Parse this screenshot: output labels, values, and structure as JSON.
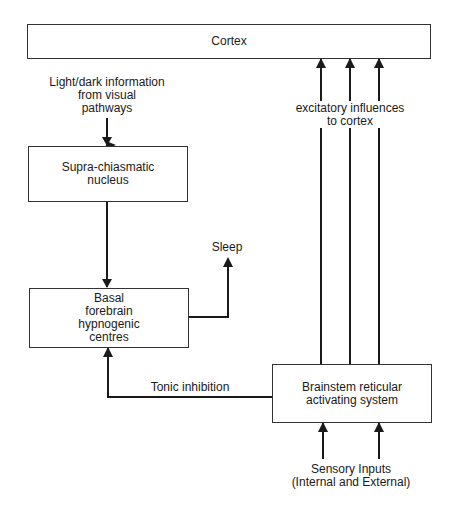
{
  "diagram": {
    "nodes": {
      "cortex": {
        "lines": [
          "Cortex"
        ]
      },
      "scn": {
        "lines": [
          "Supra-chiasmatic",
          "nucleus"
        ]
      },
      "basal": {
        "lines": [
          "Basal",
          "forebrain",
          "hypnogenic",
          "centres"
        ]
      },
      "brainstem": {
        "lines": [
          "Brainstem reticular",
          "activating system"
        ]
      }
    },
    "labels": {
      "light_dark": [
        "Light/dark information",
        "from visual",
        "pathways"
      ],
      "excitatory": [
        "excitatory influences",
        "to cortex"
      ],
      "sleep": "Sleep",
      "tonic": "Tonic inhibition",
      "sensory": [
        "Sensory Inputs",
        "(Internal and External)"
      ]
    },
    "edges": [
      {
        "from": "light_dark",
        "to": "scn"
      },
      {
        "from": "scn",
        "to": "basal"
      },
      {
        "from": "basal",
        "to": "sleep"
      },
      {
        "from": "brainstem",
        "to": "basal",
        "label": "Tonic inhibition"
      },
      {
        "from": "brainstem",
        "to": "cortex",
        "label": "excitatory influences to cortex",
        "count": 3
      },
      {
        "from": "sensory",
        "to": "brainstem",
        "count": 2
      }
    ],
    "colors": {
      "stroke": "#1a1a1a",
      "background": "#ffffff"
    }
  }
}
